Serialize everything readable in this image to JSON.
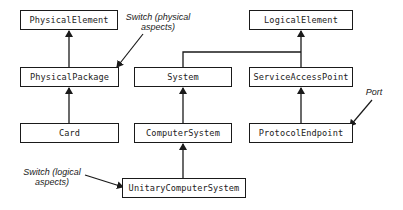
{
  "diagram": {
    "type": "class-hierarchy",
    "nodes": {
      "physical_element": "PhysicalElement",
      "physical_package": "PhysicalPackage",
      "card": "Card",
      "logical_element": "LogicalElement",
      "system": "System",
      "service_access_point": "ServiceAccessPoint",
      "computer_system": "ComputerSystem",
      "protocol_endpoint": "ProtocolEndpoint",
      "unitary_computer_system": "UnitaryComputerSystem"
    },
    "annotations": {
      "switch_physical_line1": "Switch (physical",
      "switch_physical_line2": "aspects)",
      "port": "Port",
      "switch_logical_line1": "Switch (logical",
      "switch_logical_line2": "aspects)"
    },
    "edges": [
      {
        "from": "PhysicalPackage",
        "to": "PhysicalElement",
        "kind": "inherits"
      },
      {
        "from": "Card",
        "to": "PhysicalPackage",
        "kind": "inherits"
      },
      {
        "from": "System",
        "to": "LogicalElement",
        "kind": "inherits"
      },
      {
        "from": "ServiceAccessPoint",
        "to": "LogicalElement",
        "kind": "inherits"
      },
      {
        "from": "ComputerSystem",
        "to": "System",
        "kind": "inherits"
      },
      {
        "from": "ProtocolEndpoint",
        "to": "ServiceAccessPoint",
        "kind": "inherits"
      },
      {
        "from": "UnitaryComputerSystem",
        "to": "ComputerSystem",
        "kind": "inherits"
      },
      {
        "from": "Switch (physical aspects)",
        "to": "PhysicalPackage",
        "kind": "annotation"
      },
      {
        "from": "Port",
        "to": "ProtocolEndpoint",
        "kind": "annotation"
      },
      {
        "from": "Switch (logical aspects)",
        "to": "UnitaryComputerSystem",
        "kind": "annotation"
      }
    ],
    "colors": {
      "stroke": "#1a1a1a",
      "text": "#222222",
      "background": "#ffffff"
    }
  }
}
